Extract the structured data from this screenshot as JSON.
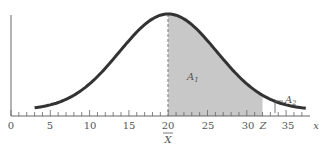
{
  "chart_data": {
    "type": "area",
    "title": "",
    "xlabel": "x",
    "ylabel": "",
    "xlim": [
      0,
      37.5
    ],
    "x_ticks": [
      0,
      5,
      10,
      15,
      20,
      25,
      30,
      35
    ],
    "x_tick_labels": [
      "0",
      "5",
      "10",
      "15",
      "20",
      "25",
      "30",
      "35"
    ],
    "minor_tick_interval": 1,
    "mean": 20,
    "z_position": 32,
    "curve_x_range": [
      3,
      37.5
    ],
    "shaded_region": {
      "from": 20,
      "to": 32,
      "label": "A1"
    },
    "tail_region": {
      "from": 32,
      "to": 37.5,
      "label": "A2"
    },
    "annotations": [
      "A1",
      "A2",
      "Z",
      "X̄"
    ],
    "grid": false,
    "legend": false
  },
  "labels": {
    "ticks": [
      "0",
      "5",
      "10",
      "15",
      "20",
      "25",
      "30",
      "35"
    ],
    "z": "Z",
    "xbar": "X",
    "x_axis": "x",
    "a1_main": "A",
    "a1_sub": "1",
    "a2_main": "A",
    "a2_sub": "2"
  },
  "colors": {
    "curve": "#333333",
    "shade": "#c8c8c8",
    "axis": "#666666"
  }
}
